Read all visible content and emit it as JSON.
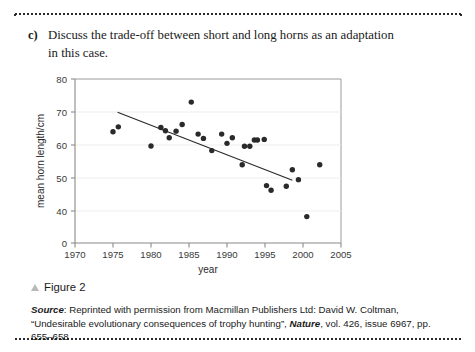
{
  "question": {
    "label": "c)",
    "text": "Discuss the trade-off between short and long horns as an adaptation in this case."
  },
  "caption": {
    "marker": "triangle-bullet",
    "text": "Figure 2"
  },
  "source": {
    "prefix": "Source",
    "colon": ": ",
    "part1": "Reprinted with permission from Macmillan Publishers Ltd: David W. Coltman, “Undesirable evolutionary consequences of trophy hunting”, ",
    "journal": "Nature",
    "part2": ", vol. 426, issue 6967, pp. 655–658"
  },
  "chart_data": {
    "type": "scatter",
    "title": "",
    "xlabel": "year",
    "ylabel": "mean horn length/cm",
    "xlim": [
      1970,
      2005
    ],
    "ylim": [
      0,
      80
    ],
    "xticks": [
      1970,
      1975,
      1980,
      1985,
      1990,
      1995,
      2000,
      2005
    ],
    "yticks": [
      0,
      40,
      50,
      60,
      70,
      80
    ],
    "y_axis_break": true,
    "grid": "horizontal-light",
    "legend": "none",
    "marker_color": "#2a2a2a",
    "line_color": "#2a2a2a",
    "axis_color": "#8a8a8a",
    "points": [
      {
        "x": 1975.0,
        "y": 64.0
      },
      {
        "x": 1975.7,
        "y": 65.5
      },
      {
        "x": 1980.0,
        "y": 59.7
      },
      {
        "x": 1981.3,
        "y": 65.3
      },
      {
        "x": 1981.9,
        "y": 64.3
      },
      {
        "x": 1982.4,
        "y": 62.2
      },
      {
        "x": 1983.3,
        "y": 64.2
      },
      {
        "x": 1984.1,
        "y": 66.2
      },
      {
        "x": 1985.3,
        "y": 73.0
      },
      {
        "x": 1986.2,
        "y": 63.3
      },
      {
        "x": 1986.9,
        "y": 62.0
      },
      {
        "x": 1988.0,
        "y": 58.3
      },
      {
        "x": 1989.3,
        "y": 63.3
      },
      {
        "x": 1990.0,
        "y": 60.5
      },
      {
        "x": 1990.7,
        "y": 62.2
      },
      {
        "x": 1992.3,
        "y": 59.6
      },
      {
        "x": 1993.0,
        "y": 59.6
      },
      {
        "x": 1992.0,
        "y": 54.0
      },
      {
        "x": 1993.6,
        "y": 61.5
      },
      {
        "x": 1994.0,
        "y": 61.5
      },
      {
        "x": 1994.9,
        "y": 61.7
      },
      {
        "x": 1995.2,
        "y": 47.7
      },
      {
        "x": 1995.8,
        "y": 46.3
      },
      {
        "x": 1997.8,
        "y": 47.5
      },
      {
        "x": 1998.6,
        "y": 52.5
      },
      {
        "x": 1999.4,
        "y": 49.5
      },
      {
        "x": 2000.5,
        "y": 38.3
      },
      {
        "x": 2002.2,
        "y": 54.0
      }
    ],
    "trendline": {
      "x_start": 1975.6,
      "y_start": 69.9,
      "x_end": 1998.6,
      "y_end": 49.3,
      "description": "negative linear trend line"
    }
  }
}
